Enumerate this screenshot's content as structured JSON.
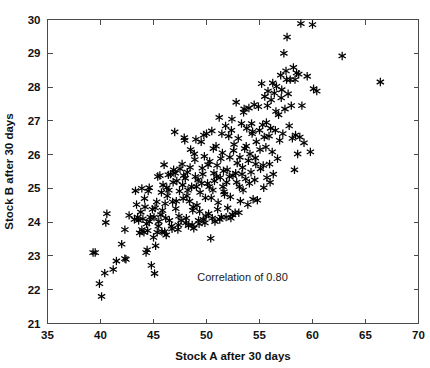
{
  "chart_data": {
    "type": "scatter",
    "title": "",
    "xlabel": "Stock A after 30 days",
    "ylabel": "Stock B after 30 days",
    "xlim": [
      35,
      70
    ],
    "ylim": [
      21,
      30
    ],
    "xticks": [
      35,
      40,
      45,
      50,
      55,
      60,
      65,
      70
    ],
    "yticks": [
      21,
      22,
      23,
      24,
      25,
      26,
      27,
      28,
      29,
      30
    ],
    "xtick_labels": [
      "35",
      "40",
      "45",
      "50",
      "55",
      "60",
      "65",
      "70"
    ],
    "ytick_labels": [
      "21",
      "22",
      "23",
      "24",
      "25",
      "26",
      "27",
      "28",
      "29",
      "30"
    ],
    "grid": false,
    "legend": null,
    "marker": "asterisk",
    "marker_color": "#000000",
    "frame": "box-all-sides-inward-ticks",
    "annotations": [
      {
        "text": "Correlation of 0.80",
        "x": 53.4,
        "y": 22.25
      }
    ],
    "series": [
      {
        "name": "Stock A vs Stock B",
        "points": [
          [
            39.3,
            23.1
          ],
          [
            39.5,
            23.1
          ],
          [
            39.9,
            22.18
          ],
          [
            40.1,
            21.8
          ],
          [
            40.4,
            22.49
          ],
          [
            40.6,
            24.25
          ],
          [
            40.5,
            23.99
          ],
          [
            41.2,
            22.6
          ],
          [
            41.5,
            22.85
          ],
          [
            42.0,
            23.35
          ],
          [
            42.3,
            22.92
          ],
          [
            42.4,
            22.9
          ],
          [
            42.3,
            23.78
          ],
          [
            42.7,
            24.2
          ],
          [
            43.3,
            24.93
          ],
          [
            43.5,
            24.15
          ],
          [
            43.6,
            24.05
          ],
          [
            43.7,
            23.68
          ],
          [
            43.8,
            24.3
          ],
          [
            43.9,
            25.0
          ],
          [
            44.0,
            24.1
          ],
          [
            44.1,
            23.7
          ],
          [
            44.2,
            24.45
          ],
          [
            44.3,
            23.1
          ],
          [
            44.4,
            23.18
          ],
          [
            44.5,
            24.92
          ],
          [
            44.6,
            25.02
          ],
          [
            44.7,
            24.15
          ],
          [
            44.8,
            22.72
          ],
          [
            44.9,
            24.38
          ],
          [
            45.0,
            23.55
          ],
          [
            45.1,
            22.48
          ],
          [
            45.2,
            23.3
          ],
          [
            45.3,
            24.6
          ],
          [
            45.4,
            25.35
          ],
          [
            45.5,
            24.02
          ],
          [
            45.6,
            25.38
          ],
          [
            45.7,
            24.22
          ],
          [
            45.8,
            23.72
          ],
          [
            45.9,
            25.1
          ],
          [
            46.0,
            25.7
          ],
          [
            46.1,
            24.55
          ],
          [
            46.2,
            23.62
          ],
          [
            46.3,
            24.78
          ],
          [
            46.4,
            25.4
          ],
          [
            46.5,
            24.05
          ],
          [
            46.6,
            25.42
          ],
          [
            46.7,
            23.88
          ],
          [
            46.8,
            24.6
          ],
          [
            46.9,
            25.55
          ],
          [
            47.0,
            26.67
          ],
          [
            47.1,
            24.4
          ],
          [
            47.2,
            25.22
          ],
          [
            47.3,
            23.78
          ],
          [
            47.4,
            24.18
          ],
          [
            47.5,
            25.58
          ],
          [
            47.6,
            24.05
          ],
          [
            47.7,
            25.72
          ],
          [
            47.8,
            24.7
          ],
          [
            47.9,
            26.5
          ],
          [
            48.0,
            25.3
          ],
          [
            48.1,
            24.12
          ],
          [
            48.2,
            25.48
          ],
          [
            48.3,
            23.9
          ],
          [
            48.4,
            24.62
          ],
          [
            48.5,
            26.15
          ],
          [
            48.6,
            25.05
          ],
          [
            48.7,
            24.35
          ],
          [
            48.8,
            23.82
          ],
          [
            48.9,
            25.85
          ],
          [
            49.0,
            26.45
          ],
          [
            49.1,
            24.5
          ],
          [
            49.2,
            25.25
          ],
          [
            49.3,
            23.95
          ],
          [
            49.4,
            24.88
          ],
          [
            49.5,
            26.38
          ],
          [
            49.6,
            25.6
          ],
          [
            49.7,
            24.08
          ],
          [
            49.8,
            25.95
          ],
          [
            49.9,
            24.72
          ],
          [
            50.0,
            26.62
          ],
          [
            50.1,
            25.15
          ],
          [
            50.2,
            24.25
          ],
          [
            50.3,
            25.8
          ],
          [
            50.4,
            23.52
          ],
          [
            50.5,
            26.7
          ],
          [
            50.6,
            24.95
          ],
          [
            50.7,
            25.45
          ],
          [
            50.8,
            24.02
          ],
          [
            50.9,
            26.25
          ],
          [
            51.0,
            25.68
          ],
          [
            51.1,
            24.58
          ],
          [
            51.2,
            27.1
          ],
          [
            51.3,
            25.32
          ],
          [
            51.4,
            24.15
          ],
          [
            51.5,
            26.05
          ],
          [
            51.6,
            25.52
          ],
          [
            51.7,
            24.82
          ],
          [
            51.8,
            26.85
          ],
          [
            51.9,
            25.18
          ],
          [
            52.0,
            24.42
          ],
          [
            52.1,
            26.55
          ],
          [
            52.2,
            25.92
          ],
          [
            52.3,
            24.12
          ],
          [
            52.4,
            27.05
          ],
          [
            52.5,
            25.38
          ],
          [
            52.6,
            26.3
          ],
          [
            52.7,
            24.28
          ],
          [
            52.8,
            27.55
          ],
          [
            52.9,
            25.75
          ],
          [
            53.0,
            26.48
          ],
          [
            53.1,
            25.05
          ],
          [
            53.2,
            24.62
          ],
          [
            53.3,
            26.92
          ],
          [
            53.4,
            25.62
          ],
          [
            53.5,
            27.25
          ],
          [
            53.6,
            26.18
          ],
          [
            53.7,
            25.28
          ],
          [
            53.8,
            26.78
          ],
          [
            53.9,
            24.52
          ],
          [
            54.0,
            27.38
          ],
          [
            54.1,
            26.02
          ],
          [
            54.2,
            25.48
          ],
          [
            54.3,
            26.62
          ],
          [
            54.4,
            24.68
          ],
          [
            54.5,
            27.48
          ],
          [
            54.6,
            25.9
          ],
          [
            54.7,
            26.38
          ],
          [
            54.8,
            24.65
          ],
          [
            54.9,
            27.42
          ],
          [
            55.0,
            26.72
          ],
          [
            55.1,
            25.58
          ],
          [
            55.2,
            28.1
          ],
          [
            55.3,
            26.88
          ],
          [
            55.4,
            25.02
          ],
          [
            55.5,
            27.72
          ],
          [
            55.6,
            26.22
          ],
          [
            55.7,
            25.32
          ],
          [
            55.8,
            27.88
          ],
          [
            55.9,
            26.55
          ],
          [
            56.0,
            25.18
          ],
          [
            56.1,
            27.62
          ],
          [
            56.2,
            26.08
          ],
          [
            56.3,
            25.42
          ],
          [
            56.4,
            27.82
          ],
          [
            56.5,
            26.72
          ],
          [
            56.6,
            28.02
          ],
          [
            56.7,
            25.88
          ],
          [
            56.8,
            27.18
          ],
          [
            56.9,
            26.42
          ],
          [
            57.0,
            28.35
          ],
          [
            57.1,
            27.92
          ],
          [
            57.2,
            26.62
          ],
          [
            57.3,
            29.0
          ],
          [
            57.4,
            27.35
          ],
          [
            57.5,
            28.48
          ],
          [
            57.6,
            29.48
          ],
          [
            57.7,
            27.8
          ],
          [
            57.8,
            26.85
          ],
          [
            57.9,
            28.22
          ],
          [
            58.0,
            27.45
          ],
          [
            58.1,
            26.48
          ],
          [
            58.2,
            28.58
          ],
          [
            58.3,
            25.55
          ],
          [
            58.4,
            26.58
          ],
          [
            58.5,
            28.42
          ],
          [
            58.6,
            26.02
          ],
          [
            58.7,
            28.38
          ],
          [
            58.8,
            26.52
          ],
          [
            58.9,
            29.88
          ],
          [
            59.0,
            27.45
          ],
          [
            59.2,
            26.35
          ],
          [
            59.5,
            28.32
          ],
          [
            59.8,
            26.08
          ],
          [
            60.0,
            29.85
          ],
          [
            60.1,
            27.95
          ],
          [
            60.4,
            27.88
          ],
          [
            62.8,
            28.92
          ],
          [
            66.4,
            28.15
          ],
          [
            43.2,
            24.08
          ],
          [
            43.4,
            24.52
          ],
          [
            44.15,
            24.7
          ],
          [
            44.35,
            23.95
          ],
          [
            45.15,
            24.42
          ],
          [
            45.45,
            23.88
          ],
          [
            45.75,
            24.88
          ],
          [
            46.15,
            24.12
          ],
          [
            46.45,
            24.95
          ],
          [
            46.85,
            25.18
          ],
          [
            47.15,
            24.62
          ],
          [
            47.45,
            24.92
          ],
          [
            47.75,
            25.1
          ],
          [
            48.15,
            24.78
          ],
          [
            48.45,
            25.62
          ],
          [
            48.75,
            24.45
          ],
          [
            49.05,
            25.05
          ],
          [
            49.35,
            24.32
          ],
          [
            49.65,
            25.42
          ],
          [
            49.95,
            24.18
          ],
          [
            50.15,
            25.7
          ],
          [
            50.45,
            24.72
          ],
          [
            50.75,
            25.22
          ],
          [
            51.05,
            24.38
          ],
          [
            51.35,
            25.88
          ],
          [
            51.65,
            24.9
          ],
          [
            51.95,
            25.55
          ],
          [
            52.25,
            24.75
          ],
          [
            52.55,
            26.12
          ],
          [
            52.85,
            25.18
          ],
          [
            53.15,
            25.92
          ],
          [
            53.45,
            24.95
          ],
          [
            53.75,
            26.25
          ],
          [
            54.05,
            25.15
          ],
          [
            54.35,
            26.68
          ],
          [
            54.65,
            25.72
          ],
          [
            55.05,
            26.15
          ],
          [
            55.35,
            25.68
          ],
          [
            55.65,
            26.95
          ],
          [
            55.95,
            25.72
          ],
          [
            44.6,
            24.02
          ],
          [
            45.05,
            24.15
          ],
          [
            45.85,
            24.35
          ],
          [
            46.25,
            25.02
          ],
          [
            47.05,
            25.45
          ],
          [
            47.85,
            25.38
          ],
          [
            48.25,
            24.95
          ],
          [
            48.95,
            25.35
          ],
          [
            49.55,
            25.15
          ],
          [
            50.25,
            25.05
          ],
          [
            50.95,
            25.35
          ],
          [
            51.55,
            25.05
          ],
          [
            52.15,
            25.35
          ],
          [
            52.75,
            25.45
          ],
          [
            53.35,
            25.42
          ],
          [
            53.95,
            25.82
          ],
          [
            54.55,
            25.25
          ],
          [
            43.9,
            23.78
          ],
          [
            44.45,
            23.75
          ],
          [
            45.35,
            23.7
          ],
          [
            46.05,
            23.72
          ],
          [
            46.75,
            23.8
          ],
          [
            47.35,
            23.92
          ],
          [
            48.05,
            23.98
          ],
          [
            48.65,
            23.92
          ],
          [
            49.25,
            24.05
          ],
          [
            49.85,
            23.98
          ],
          [
            50.55,
            24.12
          ],
          [
            51.25,
            24.08
          ],
          [
            51.85,
            24.15
          ],
          [
            52.45,
            24.22
          ],
          [
            53.05,
            24.28
          ],
          [
            55.45,
            26.52
          ],
          [
            56.05,
            26.78
          ],
          [
            56.55,
            27.28
          ],
          [
            57.05,
            27.68
          ],
          [
            53.55,
            27.35
          ],
          [
            54.25,
            26.92
          ],
          [
            52.35,
            26.72
          ],
          [
            51.45,
            26.62
          ],
          [
            50.65,
            26.18
          ],
          [
            49.75,
            26.58
          ],
          [
            48.85,
            26.02
          ],
          [
            47.95,
            26.42
          ],
          [
            56.25,
            28.12
          ],
          [
            55.75,
            27.45
          ],
          [
            57.55,
            28.22
          ],
          [
            58.35,
            28.22
          ]
        ]
      }
    ]
  }
}
